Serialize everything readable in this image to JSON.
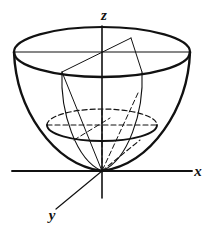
{
  "figure": {
    "kind": "math-diagram",
    "caption": "",
    "surface_name": "elliptic-paraboloid",
    "background_color": "#ffffff",
    "stroke_color": "#111111",
    "axes": [
      {
        "id": "x",
        "label": "x",
        "label_x": 198,
        "label_y": 176
      },
      {
        "id": "y",
        "label": "y",
        "label_x": 52,
        "label_y": 220
      },
      {
        "id": "z",
        "label": "z",
        "label_x": 104,
        "label_y": 20
      }
    ],
    "origin": {
      "x": 102,
      "y": 171
    },
    "rim": {
      "name": "top-rim-ellipse",
      "cx": 102,
      "cy": 52,
      "rx": 88,
      "ry": 25,
      "style": "solid"
    },
    "cross_section": {
      "name": "mid-cross-section-ellipse",
      "cx": 102,
      "cy": 125,
      "rx": 55,
      "ry": 16,
      "front_style": "solid",
      "back_style": "dashed"
    },
    "dash_pattern": "5,3",
    "line_weights": {
      "outline": 2.4,
      "axis": 1.6,
      "ruling": 1.1,
      "hidden": 1.1
    }
  }
}
